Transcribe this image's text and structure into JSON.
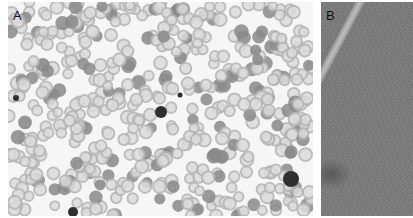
{
  "figure": {
    "panels": [
      {
        "label": "A",
        "description": "Peripheral blood smear, light microscopy, grayscale — numerous red blood cells with central pallor, scattered dark nucleated cells/leukocytes",
        "colors": {
          "background": "#f6f6f6",
          "rbc": "#b5b5b5",
          "rbc_dark": "#8a8a8a",
          "nucleus": "#2f2f2f"
        }
      },
      {
        "label": "B",
        "description": "Tissue section, low magnification, grayscale — dense granular parenchyma with a pale curved vessel-like structure and darker region lower left",
        "colors": {
          "background": "#7d7d7d",
          "vessel": "#cfcfcf"
        }
      }
    ]
  }
}
